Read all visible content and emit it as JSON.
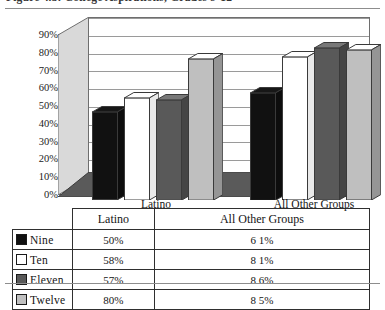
{
  "figure": {
    "caption": "Figure 4.3:  College Aspirations, Grades 9-12",
    "caption_visible_fragment": "Figure 4.3:  College Aspirations, Grades 9-12"
  },
  "chart_data": {
    "type": "bar",
    "title": "",
    "xlabel": "",
    "ylabel": "",
    "categories": [
      "Latino",
      "All Other Groups"
    ],
    "series": [
      {
        "name": "Nine",
        "values": [
          50,
          61
        ],
        "swatch_color": "#111111",
        "label_values": [
          "50%",
          "61%"
        ]
      },
      {
        "name": "Ten",
        "values": [
          58,
          81
        ],
        "swatch_color": "#ffffff",
        "label_values": [
          "58%",
          "81%"
        ]
      },
      {
        "name": "Eleven",
        "values": [
          57,
          86
        ],
        "swatch_color": "#595959",
        "label_values": [
          "57%",
          "86%"
        ]
      },
      {
        "name": "Twelve",
        "values": [
          80,
          85
        ],
        "swatch_color": "#bfbfbf",
        "label_values": [
          "80%",
          "85%"
        ]
      }
    ],
    "ylim": [
      0,
      90
    ],
    "ytick_labels": [
      "90%",
      "80%",
      "70%",
      "60%",
      "50%",
      "40%",
      "30%",
      "20%",
      "10%",
      "0%"
    ],
    "ytick_values": [
      90,
      80,
      70,
      60,
      50,
      40,
      30,
      20,
      10,
      0
    ],
    "grid": true,
    "legend_position": "table-below",
    "three_d": true
  },
  "table": {
    "corner_label": "",
    "column_headers": [
      "Latino",
      "All Other Groups"
    ],
    "rows": [
      {
        "label": "Nine",
        "swatch": "#111111",
        "cells": [
          "50%",
          "6 1%"
        ]
      },
      {
        "label": "Ten",
        "swatch": "#ffffff",
        "cells": [
          "58%",
          "8 1%"
        ]
      },
      {
        "label": "Eleven",
        "swatch": "#595959",
        "cells": [
          "57%",
          "8 6%"
        ]
      },
      {
        "label": "Twelve",
        "swatch": "#bfbfbf",
        "cells": [
          "80%",
          "8 5%"
        ]
      }
    ]
  },
  "colors": {
    "series_nine": "#111111",
    "series_ten": "#ffffff",
    "series_eleven": "#595959",
    "series_twelve": "#bfbfbf",
    "floor": "#4a4a4a",
    "sidewall": "#d4d4d4",
    "gridline": "#9a9a9a",
    "rule": "#8d8d8d"
  }
}
